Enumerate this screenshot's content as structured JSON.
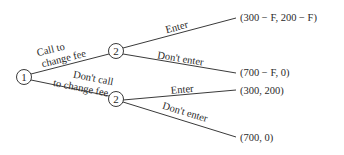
{
  "diagram": {
    "type": "game-tree",
    "nodes": [
      {
        "id": "n1",
        "player": "1",
        "x": 24,
        "y": 77
      },
      {
        "id": "n2a",
        "player": "2",
        "x": 116,
        "y": 51
      },
      {
        "id": "n2b",
        "player": "2",
        "x": 116,
        "y": 99
      }
    ],
    "edges": [
      {
        "from": "n1",
        "to": "n2a",
        "label_line1": "Call to",
        "label_line2": "change fee"
      },
      {
        "from": "n1",
        "to": "n2b",
        "label_line1": "Don't call",
        "label_line2": "to change fee"
      },
      {
        "from": "n2a",
        "label": "Enter",
        "payoff": "(300 − F, 200 − F)"
      },
      {
        "from": "n2a",
        "label": "Don't enter",
        "payoff": "(700 − F, 0)"
      },
      {
        "from": "n2b",
        "label": "Enter",
        "payoff": "(300, 200)"
      },
      {
        "from": "n2b",
        "label": "Don't enter",
        "payoff": "(700, 0)"
      }
    ],
    "colors": {
      "line": "#3a3a3a",
      "text": "#2a2a2a",
      "background": "#ffffff"
    }
  }
}
